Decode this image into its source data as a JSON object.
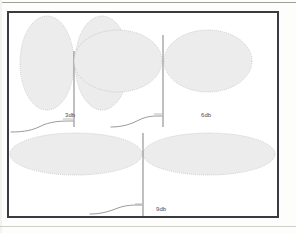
{
  "figure": {
    "kind": "antenna-radiation-pattern-diagram",
    "frame": {
      "border_color": "#3a3a42",
      "background": "#ffffff"
    },
    "lobe_style": {
      "fill": "#ececec",
      "outline": "#bdbdbd"
    },
    "mast_color": "#8b8b90",
    "patterns": [
      {
        "id": "pattern-3db",
        "gain_label": "3db",
        "shape": "tall narrow vertical lobes",
        "lobe_count": 2,
        "lobe_rx": 27,
        "lobe_ry": 47
      },
      {
        "id": "pattern-6db",
        "gain_label": "6db",
        "shape": "wide oval lobes",
        "lobe_count": 2,
        "lobe_rx": 44,
        "lobe_ry": 31
      },
      {
        "id": "pattern-9db",
        "gain_label": "9db",
        "shape": "very wide flat lobes",
        "lobe_count": 2,
        "lobe_rx": 66,
        "lobe_ry": 21
      }
    ]
  },
  "labels": {
    "gain_3db": "3db",
    "gain_6db": "6db",
    "gain_9db": "9db"
  },
  "icons": {
    "mast": "antenna-mast-icon",
    "cable": "feed-cable-icon"
  }
}
